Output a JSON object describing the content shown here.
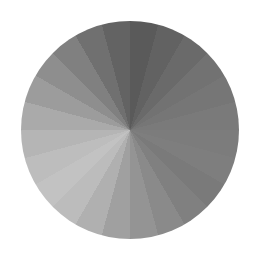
{
  "image": {
    "description": "Grayscale segmented circular wheel (pie of wedges)",
    "background": "#ffffff",
    "center": [
      130,
      130
    ],
    "radius": 109,
    "start_angle_deg": 0,
    "slices": [
      "#5a5a5a",
      "#626262",
      "#6a6a6a",
      "#727272",
      "#767676",
      "#7a7a7a",
      "#7c7c7c",
      "#7e7e7e",
      "#7a7a7a",
      "#808080",
      "#8a8a8a",
      "#949494",
      "#a0a0a0",
      "#b0b0b0",
      "#bcbcbc",
      "#c2c2c2",
      "#bdbdbd",
      "#b5b5b5",
      "#aaaaaa",
      "#9c9c9c",
      "#8e8e8e",
      "#808080",
      "#707070",
      "#636363"
    ]
  }
}
